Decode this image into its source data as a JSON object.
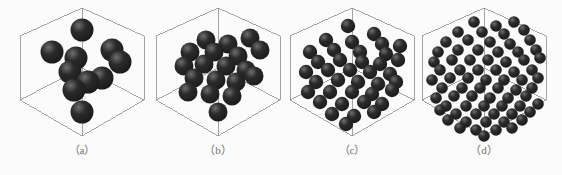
{
  "figure": {
    "background_color": "#fbfbfb",
    "width": 562,
    "height": 175,
    "panel_count": 4
  },
  "style": {
    "wireframe_color": "#8d8d8d",
    "wireframe_width": 0.8,
    "sphere_color": "#2b2b2b",
    "sphere_dark_color": "#1a1a1a",
    "sphere_highlight_color": "#6e6e6e",
    "caption_color": "#6f6f6f"
  },
  "cube": {
    "top_vertex": [
      70,
      8
    ],
    "bottom_vertex": [
      70,
      136
    ],
    "left_upper": [
      8,
      36
    ],
    "right_upper": [
      132,
      36
    ],
    "left_lower": [
      8,
      100
    ],
    "right_lower": [
      132,
      100
    ],
    "center": [
      70,
      68
    ],
    "projection": "isometric-hexagonal"
  },
  "panels": [
    {
      "id": "panel-a",
      "caption": "（a）",
      "letter": "a",
      "left": 12,
      "sphere_count": 10,
      "sphere_radius": 11.5,
      "density_label": "lowest"
    },
    {
      "id": "panel-b",
      "caption": "（b）",
      "letter": "b",
      "left": 148,
      "sphere_count": 19,
      "sphere_radius": 9.5,
      "density_label": "low"
    },
    {
      "id": "panel-c",
      "caption": "（c）",
      "letter": "c",
      "left": 282,
      "sphere_count": 38,
      "sphere_radius": 7.2,
      "density_label": "medium"
    },
    {
      "id": "panel-d",
      "caption": "（d）",
      "letter": "d",
      "left": 414,
      "sphere_count": 72,
      "sphere_radius": 5.8,
      "density_label": "high"
    }
  ],
  "chart_data": {
    "type": "scatter",
    "title": "",
    "xlabel": "",
    "ylabel": "",
    "categories": [
      "（a）",
      "（b）",
      "（c）",
      "（d）"
    ],
    "values": [
      10,
      19,
      38,
      72
    ],
    "series": [
      {
        "name": "particle count",
        "values": [
          10,
          19,
          38,
          72
        ]
      },
      {
        "name": "particle radius (px)",
        "values": [
          11.5,
          9.5,
          7.2,
          5.8
        ]
      }
    ],
    "points": {
      "panel-a": [
        [
          70,
          30
        ],
        [
          40,
          52
        ],
        [
          64,
          58
        ],
        [
          100,
          50
        ],
        [
          108,
          62
        ],
        [
          58,
          72
        ],
        [
          76,
          82
        ],
        [
          62,
          90
        ],
        [
          90,
          78
        ],
        [
          70,
          112
        ]
      ],
      "panel-b": [
        [
          58,
          40
        ],
        [
          80,
          44
        ],
        [
          102,
          38
        ],
        [
          42,
          52
        ],
        [
          66,
          52
        ],
        [
          90,
          56
        ],
        [
          112,
          50
        ],
        [
          36,
          66
        ],
        [
          56,
          64
        ],
        [
          78,
          66
        ],
        [
          98,
          70
        ],
        [
          46,
          78
        ],
        [
          68,
          80
        ],
        [
          88,
          82
        ],
        [
          106,
          76
        ],
        [
          40,
          92
        ],
        [
          62,
          94
        ],
        [
          84,
          96
        ],
        [
          70,
          112
        ]
      ],
      "panel-c": [
        [
          66,
          26
        ],
        [
          92,
          34
        ],
        [
          44,
          40
        ],
        [
          70,
          42
        ],
        [
          100,
          44
        ],
        [
          28,
          52
        ],
        [
          52,
          50
        ],
        [
          78,
          52
        ],
        [
          104,
          54
        ],
        [
          118,
          46
        ],
        [
          36,
          62
        ],
        [
          58,
          60
        ],
        [
          80,
          62
        ],
        [
          98,
          64
        ],
        [
          116,
          60
        ],
        [
          24,
          72
        ],
        [
          46,
          70
        ],
        [
          68,
          70
        ],
        [
          88,
          72
        ],
        [
          108,
          74
        ],
        [
          34,
          82
        ],
        [
          56,
          80
        ],
        [
          76,
          82
        ],
        [
          96,
          84
        ],
        [
          114,
          82
        ],
        [
          26,
          92
        ],
        [
          48,
          92
        ],
        [
          70,
          92
        ],
        [
          90,
          94
        ],
        [
          110,
          90
        ],
        [
          38,
          102
        ],
        [
          60,
          104
        ],
        [
          82,
          102
        ],
        [
          100,
          104
        ],
        [
          50,
          114
        ],
        [
          72,
          116
        ],
        [
          92,
          112
        ],
        [
          64,
          124
        ]
      ],
      "panel-d": [
        [
          60,
          22
        ],
        [
          82,
          26
        ],
        [
          100,
          22
        ],
        [
          44,
          32
        ],
        [
          68,
          32
        ],
        [
          90,
          34
        ],
        [
          110,
          30
        ],
        [
          32,
          42
        ],
        [
          54,
          40
        ],
        [
          76,
          42
        ],
        [
          96,
          44
        ],
        [
          116,
          40
        ],
        [
          24,
          52
        ],
        [
          44,
          50
        ],
        [
          64,
          50
        ],
        [
          84,
          52
        ],
        [
          104,
          52
        ],
        [
          122,
          50
        ],
        [
          20,
          62
        ],
        [
          38,
          60
        ],
        [
          56,
          60
        ],
        [
          74,
          60
        ],
        [
          92,
          62
        ],
        [
          110,
          60
        ],
        [
          126,
          58
        ],
        [
          26,
          70
        ],
        [
          46,
          70
        ],
        [
          64,
          70
        ],
        [
          82,
          70
        ],
        [
          100,
          72
        ],
        [
          118,
          70
        ],
        [
          18,
          80
        ],
        [
          36,
          78
        ],
        [
          54,
          78
        ],
        [
          72,
          80
        ],
        [
          90,
          80
        ],
        [
          108,
          80
        ],
        [
          124,
          78
        ],
        [
          28,
          88
        ],
        [
          48,
          88
        ],
        [
          66,
          88
        ],
        [
          84,
          88
        ],
        [
          102,
          90
        ],
        [
          118,
          88
        ],
        [
          22,
          98
        ],
        [
          40,
          96
        ],
        [
          58,
          96
        ],
        [
          76,
          98
        ],
        [
          94,
          98
        ],
        [
          112,
          96
        ],
        [
          32,
          106
        ],
        [
          52,
          106
        ],
        [
          70,
          106
        ],
        [
          88,
          106
        ],
        [
          106,
          106
        ],
        [
          42,
          114
        ],
        [
          62,
          114
        ],
        [
          80,
          114
        ],
        [
          98,
          114
        ],
        [
          116,
          112
        ],
        [
          52,
          122
        ],
        [
          72,
          122
        ],
        [
          90,
          122
        ],
        [
          34,
          120
        ],
        [
          108,
          120
        ],
        [
          62,
          130
        ],
        [
          82,
          130
        ],
        [
          46,
          128
        ],
        [
          98,
          128
        ],
        [
          70,
          136
        ],
        [
          26,
          110
        ],
        [
          124,
          104
        ]
      ]
    }
  }
}
